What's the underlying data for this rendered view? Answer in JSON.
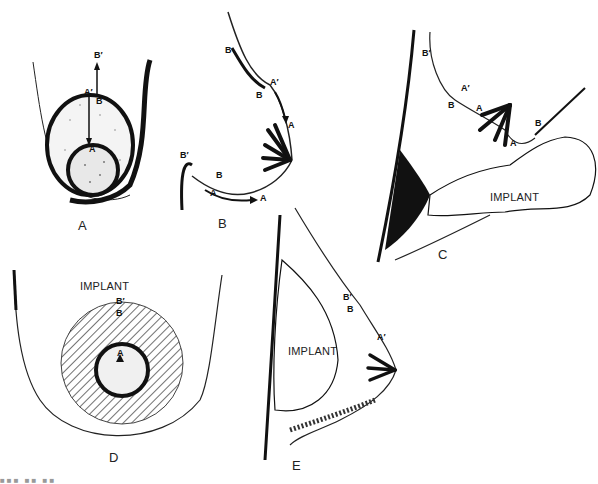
{
  "figure": {
    "panels": [
      {
        "id": "A",
        "label": "A",
        "markers": [
          "B′",
          "A′",
          "B",
          "A"
        ]
      },
      {
        "id": "B",
        "label": "B",
        "markers": [
          "B",
          "A′",
          "B",
          "A",
          "B′",
          "B",
          "A",
          "A"
        ]
      },
      {
        "id": "C",
        "label": "C",
        "markers": [
          "B′",
          "A′",
          "B",
          "A",
          "B",
          "A"
        ],
        "implant_label": "IMPLANT"
      },
      {
        "id": "D",
        "label": "D",
        "markers": [
          "B′",
          "B",
          "A"
        ],
        "implant_label": "IMPLANT"
      },
      {
        "id": "E",
        "label": "E",
        "markers": [
          "B′",
          "B",
          "A′"
        ],
        "implant_label": "IMPLANT"
      }
    ],
    "caption": "■■■ ■■ ■■"
  }
}
